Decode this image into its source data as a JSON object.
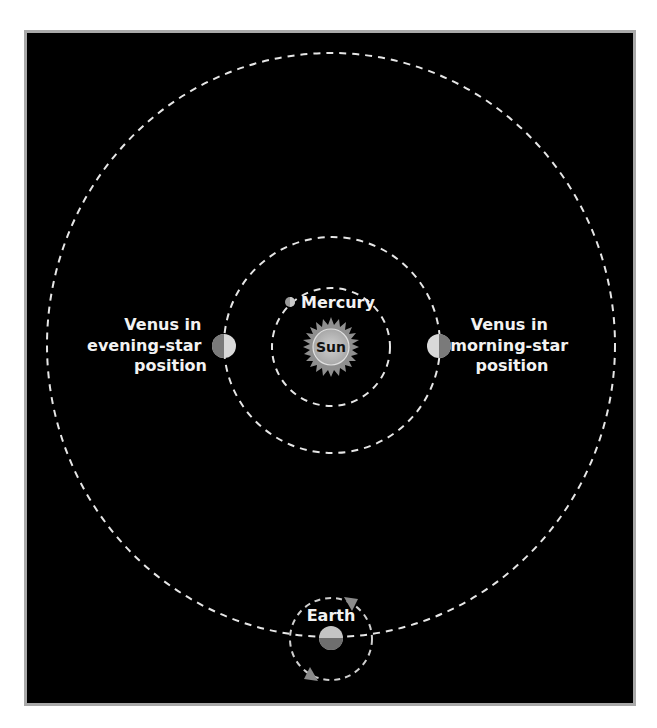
{
  "diagram": {
    "background": "#000000",
    "frame_border": "#a9a9a9",
    "orbit_color": "#e6e6e6",
    "bodies": {
      "sun": {
        "label": "Sun"
      },
      "mercury": {
        "label": "Mercury"
      },
      "earth": {
        "label": "Earth"
      },
      "venus_evening": {
        "label_lines": [
          "Venus in",
          "evening-star",
          "position"
        ]
      },
      "venus_morning": {
        "label_lines": [
          "Venus in",
          "morning-star",
          "position"
        ]
      }
    }
  }
}
